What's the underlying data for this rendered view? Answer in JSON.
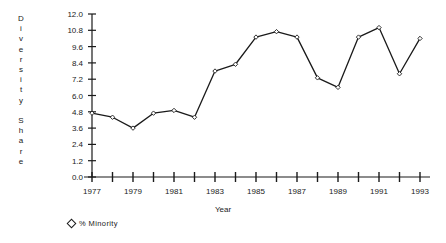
{
  "chart_data": {
    "type": "line",
    "title": "",
    "xlabel": "Year",
    "ylabel": "Diversity Share",
    "ylabel_stacked": "D\ni\nv\ne\nr\ns\ni\nt\ny\n\nS\nh\na\nr\ne",
    "x": [
      1977,
      1978,
      1979,
      1980,
      1981,
      1982,
      1983,
      1984,
      1985,
      1986,
      1987,
      1988,
      1989,
      1990,
      1991,
      1992,
      1993
    ],
    "series": [
      {
        "name": "% Minority",
        "marker": "diamond",
        "color": "#1a1a1a",
        "values": [
          4.7,
          4.4,
          3.6,
          4.7,
          4.9,
          4.4,
          7.8,
          8.3,
          10.3,
          10.7,
          10.3,
          7.3,
          6.6,
          10.3,
          11.0,
          7.6,
          10.2
        ]
      }
    ],
    "ylim": [
      0.0,
      12.0
    ],
    "ytick_step": 1.2,
    "ytick_labels": [
      "0.0",
      "1.2",
      "2.4",
      "3.6",
      "4.8",
      "6.0",
      "7.2",
      "8.4",
      "9.6",
      "10.8",
      "12.0"
    ],
    "ytick_values": [
      0.0,
      1.2,
      2.4,
      3.6,
      4.8,
      6.0,
      7.2,
      8.4,
      9.6,
      10.8,
      12.0
    ],
    "xlim": [
      1977,
      1993
    ],
    "xtick_values": [
      1977,
      1978,
      1979,
      1980,
      1981,
      1982,
      1983,
      1984,
      1985,
      1986,
      1987,
      1988,
      1989,
      1990,
      1991,
      1992,
      1993
    ],
    "xtick_labels": [
      "1977",
      "",
      "1979",
      "",
      "1981",
      "",
      "1983",
      "",
      "1985",
      "",
      "1987",
      "",
      "1989",
      "",
      "1991",
      "",
      "1993"
    ],
    "grid": false,
    "legend_position": "below-left"
  },
  "legend": {
    "entries": [
      {
        "label": "%  Minority",
        "marker": "diamond-icon"
      }
    ]
  },
  "axes": {
    "x_title": "Year",
    "y_title": "Diversity Share"
  }
}
